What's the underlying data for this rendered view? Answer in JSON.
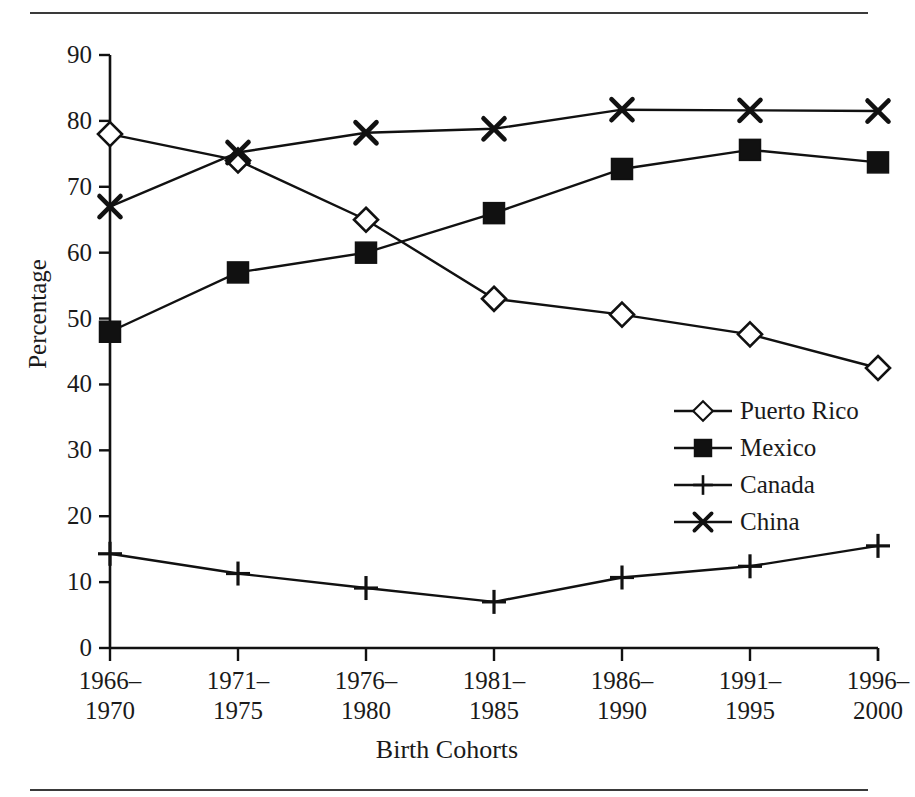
{
  "chart_data": {
    "type": "line",
    "title": "",
    "xlabel": "Birth Cohorts",
    "ylabel": "Percentage",
    "categories": [
      "1966–\n1970",
      "1971–\n1975",
      "1976–\n1980",
      "1981–\n1985",
      "1986–\n1990",
      "1991–\n1995",
      "1996–\n2000"
    ],
    "category_lines": [
      [
        "1966–",
        "1970"
      ],
      [
        "1971–",
        "1975"
      ],
      [
        "1976–",
        "1980"
      ],
      [
        "1981–",
        "1985"
      ],
      [
        "1986–",
        "1990"
      ],
      [
        "1991–",
        "1995"
      ],
      [
        "1996–",
        "2000"
      ]
    ],
    "ylim": [
      0,
      90
    ],
    "yticks": [
      0,
      10,
      20,
      30,
      40,
      50,
      60,
      70,
      80,
      90
    ],
    "ytick_labels": [
      "0",
      "10",
      "20",
      "30",
      "40",
      "50",
      "60",
      "70",
      "80",
      "90"
    ],
    "grid": false,
    "legend_position": "center-right",
    "series": [
      {
        "name": "Puerto Rico",
        "marker": "open-diamond",
        "color": "#111111",
        "values": [
          78.0,
          74.0,
          65.0,
          53.0,
          50.6,
          47.6,
          42.5
        ]
      },
      {
        "name": "Mexico",
        "marker": "filled-square",
        "color": "#111111",
        "values": [
          48.0,
          57.0,
          60.0,
          66.0,
          72.7,
          75.6,
          73.7
        ]
      },
      {
        "name": "Canada",
        "marker": "plus",
        "color": "#111111",
        "values": [
          14.3,
          11.3,
          9.1,
          7.0,
          10.7,
          12.4,
          15.5
        ]
      },
      {
        "name": "China",
        "marker": "cross",
        "color": "#111111",
        "values": [
          67.0,
          75.2,
          78.2,
          78.8,
          81.7,
          81.6,
          81.5
        ]
      }
    ]
  },
  "axis": {
    "y_title": "Percentage",
    "x_title": "Birth Cohorts"
  },
  "legend": {
    "items": [
      {
        "label": "Puerto Rico",
        "marker": "open-diamond"
      },
      {
        "label": "Mexico",
        "marker": "filled-square"
      },
      {
        "label": "Canada",
        "marker": "plus"
      },
      {
        "label": "China",
        "marker": "cross"
      }
    ]
  },
  "colors": {
    "ink": "#111111",
    "rule": "#3a3a3a",
    "background": "#ffffff"
  }
}
